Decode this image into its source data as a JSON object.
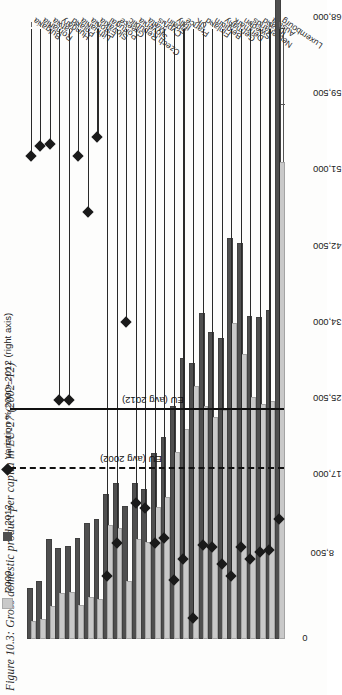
{
  "caption": "Figure 10.3: Gross domestic product per capita in EU-27 (2002–12)",
  "legend": {
    "items": [
      {
        "key": "y2000",
        "label": "2000",
        "color": "#c9c9c9",
        "marker": "square"
      },
      {
        "key": "y2012",
        "label": "2012",
        "color": "#4f4f4f",
        "marker": "square"
      },
      {
        "key": "variation",
        "label": "Variation % 2000–2012 (right axis)",
        "color": "#1a1a1a",
        "marker": "diamond"
      }
    ]
  },
  "reference_lines": [
    {
      "label": "EU (avg 2012)",
      "value": 25500,
      "style": "solid"
    },
    {
      "label": "EU (avg 2002)",
      "value": 19000,
      "style": "dashed"
    }
  ],
  "chart_data": {
    "type": "bar",
    "orientation": "horizontal",
    "title": "Gross domestic product per capita in EU-27 (2002–12)",
    "xlabel": "",
    "ylabel": "",
    "grid": false,
    "legend_position": "top-left",
    "ylim": [
      0,
      68000
    ],
    "yticks": [
      0,
      8500,
      17000,
      25500,
      34000,
      42500,
      51000,
      59500,
      68000
    ],
    "ytick_labels": [
      "0",
      "8,500",
      "17,000",
      "25,500",
      "34,000",
      "42,500",
      "51,000",
      "59,500",
      "68,000"
    ],
    "variation_axis": {
      "label": "Variation % 2000–2012 (right axis)",
      "lim": [
        0,
        260
      ]
    },
    "categories": [
      "Bulgaria",
      "Romania",
      "Latvia",
      "Hungary",
      "Poland",
      "Lithuania",
      "Estonia",
      "Slovakia",
      "Portugal",
      "Greece",
      "Czech Republic",
      "Slovenia",
      "Malta",
      "Cyprus",
      "Spain",
      "Italy",
      "France",
      "UK",
      "Finland",
      "Belgium",
      "Germany",
      "Denmark",
      "Sweden",
      "Netherlands",
      "Ireland",
      "Austria",
      "Luxembourg"
    ],
    "series": [
      {
        "name": "2000",
        "values": [
          1800,
          2000,
          3500,
          4900,
          5000,
          3600,
          4500,
          4200,
          12500,
          12200,
          6200,
          10900,
          10600,
          14500,
          15600,
          20600,
          23200,
          28000,
          25800,
          24500,
          25300,
          35000,
          31500,
          26800,
          26000,
          26300,
          53000
        ]
      },
      {
        "name": "2012",
        "values": [
          5500,
          6200,
          10900,
          9900,
          10100,
          11000,
          12700,
          13200,
          15900,
          17200,
          14600,
          17200,
          16500,
          20500,
          22300,
          25700,
          31100,
          30500,
          36100,
          34000,
          33300,
          44500,
          43900,
          35800,
          35700,
          36400,
          80000
        ]
      }
    ],
    "variation": {
      "name": "Variation % 2000–2012",
      "values": [
        206,
        210,
        211,
        102,
        102,
        206,
        182,
        214,
        27,
        41,
        135,
        58,
        56,
        41,
        43,
        25,
        34,
        9,
        40,
        39,
        32,
        27,
        39,
        34,
        37,
        38,
        51
      ]
    }
  }
}
